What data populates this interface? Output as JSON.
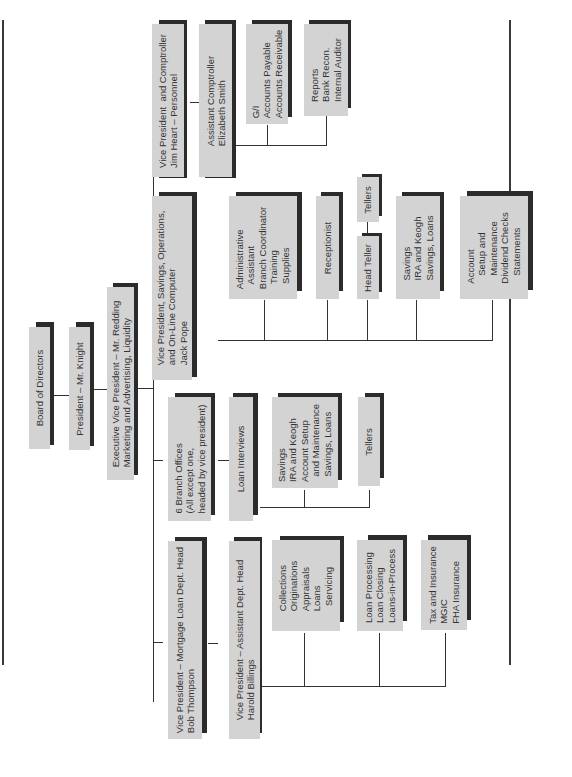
{
  "orientation": "rotated-90-ccw",
  "colors": {
    "box_fill": "#d3d3d3",
    "box_shadow": "#2b2b2b",
    "line": "#333333",
    "text": "#333333"
  },
  "nodes": {
    "board": {
      "label": "Board of Directors"
    },
    "president": {
      "label": "President – Mr. Knight"
    },
    "evp": {
      "label": "Executive Vice President – Mr. Redding\nMarketing and Advertising, Liquidity"
    },
    "vp_comptroller": {
      "label": "Vice President  and Comptroller\nJim Heart – Personnel"
    },
    "asst_comptroller": {
      "label": "Assistant Comptroller\nElizabeth Smith"
    },
    "gl": {
      "label": "G/I\nAccounts Payable\nAccounts Receivable"
    },
    "reports": {
      "label": "Reports\nBank Recon.\nInternal Auditor"
    },
    "vp_savings": {
      "label": "Vice President, Savings, Operations,\nand On-Line Computer\nJack Pope"
    },
    "admin_asst": {
      "label": "Administrative\n  Assistant\nBranch Coordinator\n  Training\n  Supplies"
    },
    "receptionist": {
      "label": "Receptionist"
    },
    "head_teller": {
      "label": "Head Teller"
    },
    "tellers_ops": {
      "label": "Tellers"
    },
    "savings_ira": {
      "label": "Savings\nIRA and Keogh\nSavings, Loans"
    },
    "account_setup": {
      "label": "Account\n   Setup and\n   Maintenance\nDividend Checks\n   Statements"
    },
    "branch_offices": {
      "label": "6 Branch Offices\n(All except one,\nheaded by vice president)"
    },
    "loan_interviews": {
      "label": "Loan Interviews"
    },
    "branch_savings": {
      "label": "Savings\nIRA and Keogh\nAccount Setup\n  and Maintenance\n  Savings, Loans"
    },
    "branch_tellers": {
      "label": "Tellers"
    },
    "vp_mortgage": {
      "label": "Vice President – Mortgage Loan Dept. Head\nBob Thompson"
    },
    "vp_assistant": {
      "label": "Vice President – Assistant Dept. Head\nHarold Billings"
    },
    "collections": {
      "label": "Collections\nOriginations\nAppraisals\nLoans\n  Servicing"
    },
    "loan_processing": {
      "label": "Loan Processing\nLoan Closing\nLoans-in-Process"
    },
    "tax_insurance": {
      "label": "Tax and Insurance\nMGIC\nFHA Insurance"
    }
  }
}
